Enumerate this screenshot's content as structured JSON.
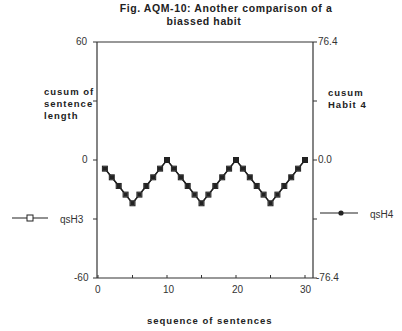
{
  "figure": {
    "title_line1": "Fig.  AQM-10:     Another  comparison  of  a",
    "title_line2": "biassed  habit"
  },
  "axes": {
    "left": {
      "label_lines": [
        "cusum  of",
        "sentence",
        "length"
      ],
      "ticks": [
        "60",
        "0",
        "-60"
      ]
    },
    "right": {
      "label_lines": [
        "cusum",
        "Habit  4"
      ],
      "ticks": [
        "76.4",
        "0.0",
        "-76.4"
      ]
    },
    "bottom": {
      "label": "sequence  of  sentences",
      "ticks": [
        "0",
        "10",
        "20",
        "30"
      ]
    }
  },
  "legend": {
    "left_series": "qsH3",
    "right_series": "qsH4"
  },
  "colors": {
    "line": "#222222",
    "axis": "#333333"
  },
  "chart_data": {
    "type": "line",
    "title": "Fig. AQM-10: Another comparison of a biassed habit",
    "xlabel": "sequence of sentences",
    "ylabel": "cusum of sentence length",
    "ylabel_right": "cusum Habit 4",
    "xlim": [
      0,
      31
    ],
    "ylim": [
      -60,
      60
    ],
    "ylim_right": [
      -76.4,
      76.4
    ],
    "x_ticks": [
      0,
      10,
      20,
      30
    ],
    "y_ticks": [
      -60,
      0,
      60
    ],
    "y_ticks_right": [
      -76.4,
      0.0,
      76.4
    ],
    "grid": false,
    "legend_position": "outside left/right",
    "x": [
      1,
      2,
      3,
      4,
      5,
      6,
      7,
      8,
      9,
      10,
      11,
      12,
      13,
      14,
      15,
      16,
      17,
      18,
      19,
      20,
      21,
      22,
      23,
      24,
      25,
      26,
      27,
      28,
      29,
      30
    ],
    "series": [
      {
        "name": "qsH3",
        "marker": "open-square",
        "axis": "left",
        "values": [
          -4.4,
          -8.8,
          -13.2,
          -17.6,
          -22,
          -17.6,
          -13.2,
          -8.8,
          -4.4,
          0,
          -4.4,
          -8.8,
          -13.2,
          -17.6,
          -22,
          -17.6,
          -13.2,
          -8.8,
          -4.4,
          0,
          -4.4,
          -8.8,
          -13.2,
          -17.6,
          -22,
          -17.6,
          -13.2,
          -8.8,
          -4.4,
          0
        ]
      },
      {
        "name": "qsH4",
        "marker": "filled-square",
        "axis": "right",
        "values": [
          -5.6,
          -11.2,
          -16.8,
          -22.4,
          -28,
          -22.4,
          -16.8,
          -11.2,
          -5.6,
          0,
          -5.6,
          -11.2,
          -16.8,
          -22.4,
          -28,
          -22.4,
          -16.8,
          -11.2,
          -5.6,
          0,
          -5.6,
          -11.2,
          -16.8,
          -22.4,
          -28,
          -22.4,
          -16.8,
          -11.2,
          -5.6,
          0
        ]
      }
    ]
  }
}
